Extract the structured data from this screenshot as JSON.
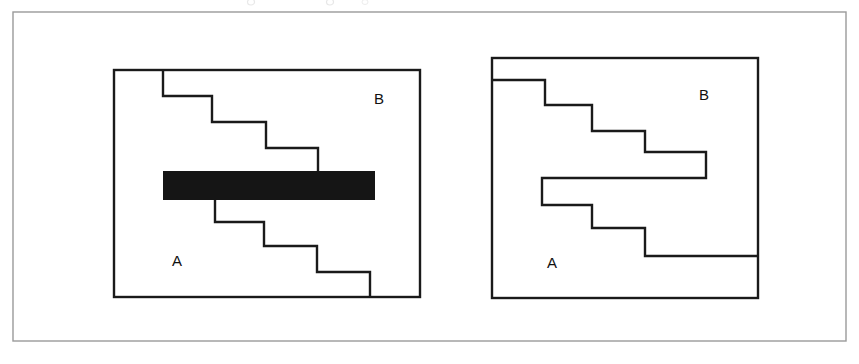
{
  "figure": {
    "caption_fragment_above": "",
    "background_color": "#ffffff",
    "outer_frame": {
      "name": "outer-figure-border",
      "x": 13,
      "y": 12,
      "width": 833,
      "height": 329,
      "stroke_color": "#9a9a9a",
      "stroke_width": 1.4
    },
    "ink_color": "#1a1a1a",
    "gap_fill_color": "#151515",
    "panels": [
      {
        "id": "left",
        "name": "panel-left-unresolved-gap",
        "box": {
          "x": 114,
          "y": 70,
          "width": 306,
          "height": 227
        },
        "labels": [
          {
            "text": "B",
            "x": 374,
            "y": 104,
            "region": "upper-right"
          },
          {
            "text": "A",
            "x": 172,
            "y": 266,
            "region": "lower-left"
          }
        ],
        "upper_staircase": {
          "name": "upper-step-boundary",
          "description": "descending staircase from top edge of panel down to the black gap bar",
          "points": [
            [
              163,
              70
            ],
            [
              163,
              96
            ],
            [
              212,
              96
            ],
            [
              212,
              122
            ],
            [
              266,
              122
            ],
            [
              266,
              148
            ],
            [
              318,
              148
            ],
            [
              318,
              171
            ]
          ]
        },
        "gap_bar": {
          "name": "occluding-black-bar",
          "x": 163,
          "y": 171,
          "width": 212,
          "height": 29,
          "fill": "#151515"
        },
        "lower_staircase": {
          "name": "lower-step-boundary",
          "description": "descending staircase from bottom of black gap bar to bottom edge of panel",
          "points": [
            [
              215,
              200
            ],
            [
              215,
              222
            ],
            [
              264,
              222
            ],
            [
              264,
              246
            ],
            [
              317,
              246
            ],
            [
              317,
              272
            ],
            [
              370,
              272
            ],
            [
              370,
              297
            ]
          ]
        }
      },
      {
        "id": "right",
        "name": "panel-right-completed-contour",
        "box": {
          "x": 492,
          "y": 58,
          "width": 266,
          "height": 240
        },
        "labels": [
          {
            "text": "B",
            "x": 699,
            "y": 100,
            "region": "upper-right"
          },
          {
            "text": "A",
            "x": 547,
            "y": 268,
            "region": "lower-left"
          }
        ],
        "contour": {
          "name": "continuous-step-contour-with-notch",
          "description": "single continuous boundary: upper staircase, rightward tongue, U-notch reversal, lower staircase",
          "points": [
            [
              492,
              80
            ],
            [
              545,
              80
            ],
            [
              545,
              105
            ],
            [
              592,
              105
            ],
            [
              592,
              131
            ],
            [
              645,
              131
            ],
            [
              645,
              152
            ],
            [
              706,
              152
            ],
            [
              706,
              178
            ],
            [
              542,
              178
            ],
            [
              542,
              205
            ],
            [
              592,
              205
            ],
            [
              592,
              228
            ],
            [
              645,
              228
            ],
            [
              645,
              256
            ],
            [
              758,
              256
            ]
          ]
        }
      }
    ]
  }
}
